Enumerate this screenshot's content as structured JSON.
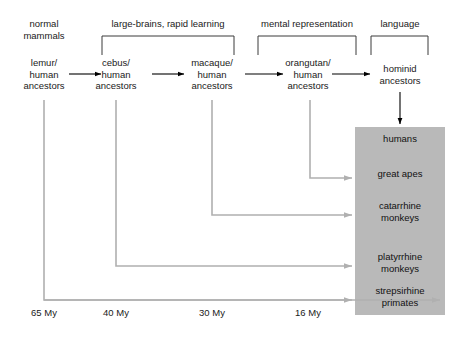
{
  "diagram": {
    "colors": {
      "box_fill": "#b9b9b9",
      "branch_line": "#b0b0b0",
      "arrow_black": "#000000",
      "text": "#1a1a1a"
    },
    "categories": [
      {
        "label_line1": "normal",
        "label_line2": "mammals",
        "has_bracket": false
      },
      {
        "label_line1": "large-brains, rapid learning",
        "label_line2": "",
        "has_bracket": true
      },
      {
        "label_line1": "mental representation",
        "label_line2": "",
        "has_bracket": true
      },
      {
        "label_line1": "language",
        "label_line2": "",
        "has_bracket": true
      }
    ],
    "nodes": [
      {
        "line1": "lemur/",
        "line2": "human",
        "line3": "ancestors"
      },
      {
        "line1": "cebus/",
        "line2": "human",
        "line3": "ancestors"
      },
      {
        "line1": "macaque/",
        "line2": "human",
        "line3": "ancestors"
      },
      {
        "line1": "orangutan/",
        "line2": "human",
        "line3": "ancestors"
      },
      {
        "line1": "hominid",
        "line2": "ancestors",
        "line3": ""
      }
    ],
    "taxa": [
      {
        "line1": "humans",
        "line2": ""
      },
      {
        "line1": "great apes",
        "line2": ""
      },
      {
        "line1": "catarrhine",
        "line2": "monkeys"
      },
      {
        "line1": "platyrrhine",
        "line2": "monkeys"
      },
      {
        "line1": "strepsirhine",
        "line2": "primates"
      }
    ],
    "timeline": {
      "ticks": [
        "65 My",
        "40 My",
        "30 My",
        "16 My"
      ],
      "unit": "My"
    }
  }
}
